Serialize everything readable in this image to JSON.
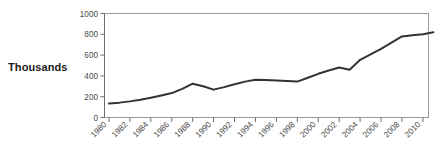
{
  "chart_data": {
    "type": "line",
    "title": "",
    "subtitle": "",
    "xlabel": "",
    "ylabel": "Thousands",
    "ylim": [
      0,
      1000
    ],
    "xlim": [
      1980,
      2011
    ],
    "grid": false,
    "legend": null,
    "y_ticks": [
      0,
      200,
      400,
      600,
      800,
      1000
    ],
    "y_tick_labels": [
      "0",
      "200",
      "400",
      "600",
      "800",
      "1000"
    ],
    "x_ticks": [
      1980,
      1982,
      1984,
      1986,
      1988,
      1990,
      1992,
      1994,
      1996,
      1998,
      2000,
      2002,
      2004,
      2006,
      2008,
      2010
    ],
    "x_tick_labels": [
      "1980",
      "1982",
      "1984",
      "1986",
      "1988",
      "1990",
      "1992",
      "1994",
      "1996",
      "1998",
      "2000",
      "2002",
      "2004",
      "2006",
      "2008",
      "2010"
    ],
    "x_tick_rotation": 45,
    "line_color": "#333333",
    "line_width": 2,
    "series": [
      {
        "name": "Thousands",
        "x": [
          1980,
          1981,
          1982,
          1983,
          1984,
          1985,
          1986,
          1987,
          1988,
          1989,
          1990,
          1991,
          1992,
          1993,
          1994,
          1995,
          1996,
          1997,
          1998,
          1999,
          2000,
          2001,
          2002,
          2003,
          2004,
          2005,
          2006,
          2007,
          2008,
          2009,
          2010,
          2011
        ],
        "values": [
          135,
          143,
          155,
          170,
          190,
          212,
          235,
          275,
          325,
          300,
          268,
          292,
          320,
          345,
          362,
          360,
          355,
          350,
          345,
          382,
          420,
          452,
          480,
          460,
          555,
          607,
          660,
          720,
          780,
          790,
          800,
          820
        ]
      }
    ]
  },
  "labels": {
    "y_axis_title": "Thousands"
  }
}
